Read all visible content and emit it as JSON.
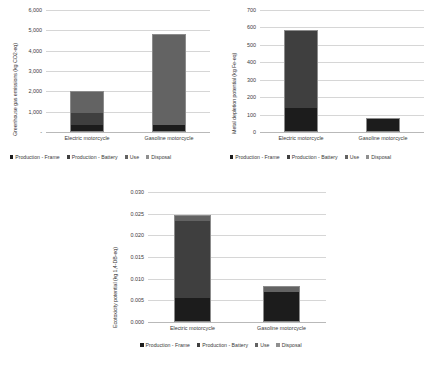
{
  "figure": {
    "background": "#ffffff",
    "series_colors": {
      "production_frame": "#1c1c1c",
      "production_battery": "#3f3f3f",
      "use": "#636363",
      "disposal": "#8f8f8f"
    },
    "legend_labels": [
      "Production - Frame",
      "Production - Battery",
      "Use",
      "Disposal"
    ],
    "categories": [
      "Electric motorcycle",
      "Gasoline motorcycle"
    ]
  },
  "chart_data": [
    {
      "id": "greenhouse-gas",
      "type": "bar",
      "stacked": true,
      "title": "",
      "xlabel": "",
      "ylabel": "Greenhouse gas emissions (kg CO2-eq)",
      "categories": [
        "Electric motorcycle",
        "Gasoline motorcycle"
      ],
      "ylim": [
        0,
        6000
      ],
      "yticks": [
        0,
        1000,
        2000,
        3000,
        4000,
        5000,
        6000
      ],
      "ytick_labels": [
        "-",
        "1,000",
        "2,000",
        "3,000",
        "4,000",
        "5,000",
        "6,000"
      ],
      "grid": true,
      "legend_position": "bottom",
      "series": [
        {
          "name": "Production - Frame",
          "values": [
            330,
            285
          ]
        },
        {
          "name": "Production - Battery",
          "values": [
            600,
            0
          ]
        },
        {
          "name": "Use",
          "values": [
            1100,
            4560
          ]
        },
        {
          "name": "Disposal",
          "values": [
            0,
            0
          ]
        }
      ],
      "totals": [
        2030,
        4845
      ]
    },
    {
      "id": "metal-depletion",
      "type": "bar",
      "stacked": true,
      "title": "",
      "xlabel": "",
      "ylabel": "Metal depletion potential (kg Fe-eq)",
      "categories": [
        "Electric motorcycle",
        "Gasoline motorcycle"
      ],
      "ylim": [
        0,
        700
      ],
      "yticks": [
        0,
        100,
        200,
        300,
        400,
        500,
        600,
        700
      ],
      "ytick_labels": [
        "0",
        "100",
        "200",
        "300",
        "400",
        "500",
        "600",
        "700"
      ],
      "grid": true,
      "legend_position": "bottom",
      "series": [
        {
          "name": "Production - Frame",
          "values": [
            135,
            78
          ]
        },
        {
          "name": "Production - Battery",
          "values": [
            450,
            0
          ]
        },
        {
          "name": "Use",
          "values": [
            0,
            0
          ]
        },
        {
          "name": "Disposal",
          "values": [
            0,
            0
          ]
        }
      ],
      "totals": [
        585,
        78
      ]
    },
    {
      "id": "ecotoxicity",
      "type": "bar",
      "stacked": true,
      "title": "",
      "xlabel": "",
      "ylabel": "Ecotoxicity potential (kg 1,4-DB-eq)",
      "categories": [
        "Electric motorcycle",
        "Gasoline motorcycle"
      ],
      "ylim": [
        0,
        0.03
      ],
      "yticks": [
        0,
        0.005,
        0.01,
        0.015,
        0.02,
        0.025,
        0.03
      ],
      "ytick_labels": [
        "0.000",
        "0.005",
        "0.010",
        "0.015",
        "0.020",
        "0.025",
        "0.030"
      ],
      "grid": true,
      "legend_position": "bottom",
      "series": [
        {
          "name": "Production - Frame",
          "values": [
            0.0055,
            0.0072
          ]
        },
        {
          "name": "Production - Battery",
          "values": [
            0.018,
            0.0
          ]
        },
        {
          "name": "Use",
          "values": [
            0.0013,
            0.0011
          ]
        },
        {
          "name": "Disposal",
          "values": [
            0.0,
            0.0
          ]
        }
      ],
      "totals": [
        0.0248,
        0.0083
      ]
    }
  ]
}
